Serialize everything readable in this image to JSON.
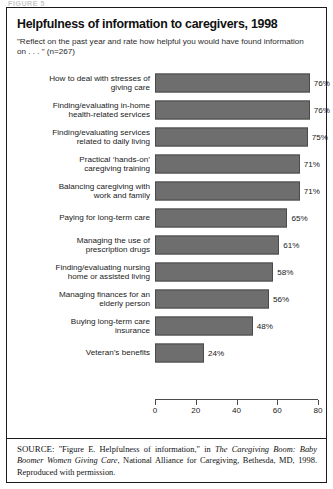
{
  "top_cut_text": "FIGURE 5",
  "card": {
    "title": "Helpfulness of information to caregivers, 1998",
    "subtitle": "\"Reflect on the past year and rate how helpful you would have found information on . . . \" (n=267)"
  },
  "source": {
    "label": "SOURCE:",
    "part1": " \"Figure E. Helpfulness of information,\" in ",
    "italic": "The Caregiving Boom: Baby Boomer Women Giving Care",
    "part2": ", National Alliance for Caregiving, Bethesda, MD, 1998. Reproduced with permission."
  },
  "colors": {
    "bar": "#6e6e6e",
    "bar_border": "#4a4a4a",
    "axis": "#4a4a4a",
    "frame": "#1b1b1b"
  },
  "chart_data": {
    "type": "bar",
    "orientation": "horizontal",
    "title": "Helpfulness of information to caregivers, 1998",
    "subtitle": "\"Reflect on the past year and rate how helpful you would have found information on . . . \" (n=267)",
    "xlabel": "",
    "ylabel": "",
    "xlim": [
      0,
      80
    ],
    "xticks": [
      0,
      20,
      40,
      60,
      80
    ],
    "grid": false,
    "legend": null,
    "value_suffix": "%",
    "categories": [
      "How to deal with stresses of giving care",
      "Finding/evaluating in-home health-related services",
      "Finding/evaluating services related to daily living",
      "Practical ‘hands-on’ caregiving training",
      "Balancing caregiving with work and family",
      "Paying for long-term care",
      "Managing the use of prescription drugs",
      "Finding/evaluating nursing home or assisted living",
      "Managing finances for an elderly person",
      "Buying long-term care insurance",
      "Veteran’s benefits"
    ],
    "category_lines": [
      [
        "How to deal with stresses of",
        "giving care"
      ],
      [
        "Finding/evaluating in-home",
        "health-related services"
      ],
      [
        "Finding/evaluating services",
        "related to daily living"
      ],
      [
        "Practical ‘hands-on’",
        "caregiving training"
      ],
      [
        "Balancing caregiving with",
        "work and family"
      ],
      [
        "Paying for long-term care"
      ],
      [
        "Managing the use of",
        "prescription drugs"
      ],
      [
        "Finding/evaluating nursing",
        "home or assisted living"
      ],
      [
        "Managing finances for an",
        "elderly person"
      ],
      [
        "Buying long-term care",
        "insurance"
      ],
      [
        "Veteran’s benefits"
      ]
    ],
    "values": [
      76,
      76,
      75,
      71,
      71,
      65,
      61,
      58,
      56,
      48,
      24
    ],
    "value_labels": [
      "76%",
      "76%",
      "75%",
      "71%",
      "71%",
      "65%",
      "61%",
      "58%",
      "56%",
      "48%",
      "24%"
    ]
  }
}
